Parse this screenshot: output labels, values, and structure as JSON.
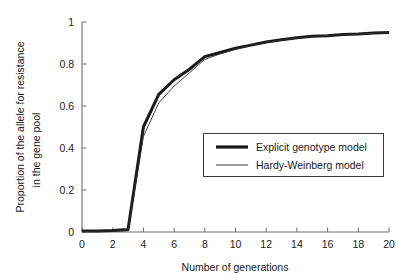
{
  "chart_data": {
    "type": "line",
    "title": "",
    "xlabel": "Number of generations",
    "ylabel": "Proportion of the allele for resistance in the gene pool",
    "ylabel_line1": "Proportion of the allele for resistance",
    "ylabel_line2": "in the gene pool",
    "xlim": [
      0,
      20
    ],
    "ylim": [
      0,
      1
    ],
    "xticks": [
      0,
      2,
      4,
      6,
      8,
      10,
      12,
      14,
      16,
      18,
      20
    ],
    "xtick_labels": [
      "0",
      "2",
      "4",
      "6",
      "8",
      "10",
      "12",
      "14",
      "16",
      "18",
      "20"
    ],
    "yticks": [
      0,
      0.2,
      0.4,
      0.6,
      0.8,
      1
    ],
    "ytick_labels": [
      "0",
      "0.2",
      "0.4",
      "0.6",
      "0.8",
      "1"
    ],
    "grid": false,
    "legend_position": "center-right",
    "x": [
      0,
      1,
      2,
      3,
      4,
      5,
      6,
      7,
      8,
      9,
      10,
      11,
      12,
      13,
      14,
      15,
      16,
      17,
      18,
      19,
      20
    ],
    "series": [
      {
        "name": "Explicit genotype model",
        "style": "thick",
        "color": "#1a1a1a",
        "linewidth": 3.0,
        "values": [
          0.005,
          0.005,
          0.007,
          0.012,
          0.5,
          0.655,
          0.725,
          0.775,
          0.835,
          0.855,
          0.875,
          0.89,
          0.905,
          0.915,
          0.925,
          0.932,
          0.935,
          0.94,
          0.943,
          0.948,
          0.95
        ]
      },
      {
        "name": "Hardy-Weinberg model",
        "style": "thin",
        "color": "#2b2b2b",
        "linewidth": 0.9,
        "values": [
          0.003,
          0.003,
          0.004,
          0.006,
          0.455,
          0.615,
          0.695,
          0.758,
          0.822,
          0.848,
          0.87,
          0.887,
          0.902,
          0.913,
          0.923,
          0.93,
          0.934,
          0.939,
          0.942,
          0.947,
          0.949
        ]
      }
    ]
  },
  "axes": {
    "x_title": "Number of generations",
    "y_title_line1": "Proportion of the allele for resistance",
    "y_title_line2": "in the gene pool"
  },
  "legend": {
    "entries": [
      {
        "label": "Explicit genotype model"
      },
      {
        "label": "Hardy-Weinberg model"
      }
    ]
  },
  "colors": {
    "ink": "#1a1a1a",
    "axis": "#6e6e6e",
    "thin_line": "#2b2b2b",
    "legend_border": "#3a3a3a",
    "background": "#ffffff"
  }
}
